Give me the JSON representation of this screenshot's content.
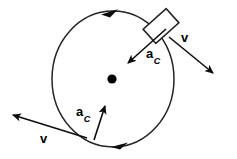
{
  "figure": {
    "domain": "Diagram",
    "canvas": {
      "width": 237,
      "height": 159,
      "background": "#ffffff"
    },
    "stroke_color": "#1a1a1a",
    "fill_color": "#000000"
  },
  "labels": {
    "velocity_top_right": "v",
    "velocity_bottom_left": "v",
    "accel_top_right_symbol": "a",
    "accel_top_right_subscript": "C",
    "accel_bottom_left_symbol": "a",
    "accel_bottom_left_subscript": "C"
  },
  "geometry": {
    "circle": {
      "cx": 113,
      "cy": 79,
      "rx": 61,
      "ry": 68
    },
    "center_dot": {
      "cx": 112,
      "cy": 79,
      "r": 4.5
    },
    "block": {
      "cx": 161,
      "cy": 26,
      "width": 30,
      "height": 19,
      "rotation_deg": -42
    },
    "motion_direction": "clockwise"
  },
  "vectors": [
    {
      "name": "velocity-top-right",
      "symbol": "v",
      "from": {
        "x": 168,
        "y": 36
      },
      "to": {
        "x": 216,
        "y": 76
      },
      "kind": "velocity",
      "description": "tangential velocity at top-right, pointing down-right"
    },
    {
      "name": "acceleration-top-right",
      "symbol": "a_C",
      "from": {
        "x": 164,
        "y": 30
      },
      "to": {
        "x": 125,
        "y": 65
      },
      "kind": "centripetal-acceleration",
      "description": "centripetal acceleration at top-right, pointing toward center"
    },
    {
      "name": "velocity-bottom-left",
      "symbol": "v",
      "from": {
        "x": 86,
        "y": 138
      },
      "to": {
        "x": 9,
        "y": 114
      },
      "kind": "velocity",
      "description": "tangential velocity at bottom-left, pointing up-left"
    },
    {
      "name": "acceleration-bottom-left",
      "symbol": "a_C",
      "from": {
        "x": 94,
        "y": 141
      },
      "to": {
        "x": 106,
        "y": 104
      },
      "kind": "centripetal-acceleration",
      "description": "centripetal acceleration at bottom-left, pointing up toward center"
    }
  ],
  "path_arrows": [
    {
      "name": "circle-direction-arrow-top",
      "at": {
        "x": 111,
        "y": 12
      },
      "direction_deg": 8,
      "description": "direction of travel marker on top of circle pointing right"
    },
    {
      "name": "circle-direction-arrow-bottom",
      "at": {
        "x": 119,
        "y": 145
      },
      "direction_deg": 192,
      "description": "direction of travel marker on bottom of circle pointing left"
    }
  ],
  "label_positions": {
    "velocity_top_right": {
      "x": 181,
      "y": 30
    },
    "accel_top_right": {
      "x": 146,
      "y": 46
    },
    "accel_bottom_left": {
      "x": 75,
      "y": 104
    },
    "velocity_bottom_left": {
      "x": 39,
      "y": 131
    }
  }
}
